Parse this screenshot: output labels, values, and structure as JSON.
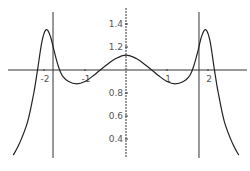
{
  "chart_data": {
    "type": "line",
    "title": "",
    "xlabel": "",
    "ylabel": "",
    "xlim": [
      -2.8,
      2.95
    ],
    "ylim": [
      0.25,
      1.55
    ],
    "axes_cross_at": {
      "x": 0,
      "y": 1.0
    },
    "grid": false,
    "legend": null,
    "x_ticks": [
      {
        "value": -2,
        "label": "-2"
      },
      {
        "value": -1,
        "label": "-1"
      },
      {
        "value": 1,
        "label": "1"
      },
      {
        "value": 2,
        "label": "2"
      }
    ],
    "y_ticks": [
      {
        "value": 1.4,
        "label": "1.4"
      },
      {
        "value": 1.2,
        "label": "1.2"
      },
      {
        "value": 0.8,
        "label": "0.8"
      },
      {
        "value": 0.6,
        "label": "0.6"
      },
      {
        "value": 0.4,
        "label": "0.4"
      }
    ],
    "vertical_lines": [
      -1.78,
      1.78
    ],
    "series": [
      {
        "name": "f(x)",
        "x": [
          -2.75,
          -2.6,
          -2.4,
          -2.25,
          -2.15,
          -2.05,
          -1.95,
          -1.85,
          -1.75,
          -1.65,
          -1.55,
          -1.4,
          -1.2,
          -1.0,
          -0.8,
          -0.63,
          -0.45,
          -0.25,
          0,
          0.25,
          0.45,
          0.63,
          0.8,
          1.0,
          1.2,
          1.4,
          1.55,
          1.65,
          1.75,
          1.85,
          1.95,
          2.05,
          2.15,
          2.25,
          2.4,
          2.6,
          2.75
        ],
        "y": [
          0.26,
          0.36,
          0.55,
          0.8,
          1.02,
          1.25,
          1.35,
          1.3,
          1.16,
          1.03,
          0.95,
          0.9,
          0.88,
          0.9,
          0.95,
          1.0,
          1.05,
          1.1,
          1.13,
          1.1,
          1.05,
          1.0,
          0.95,
          0.9,
          0.88,
          0.9,
          0.95,
          1.03,
          1.16,
          1.3,
          1.35,
          1.25,
          1.02,
          0.8,
          0.55,
          0.36,
          0.26
        ]
      }
    ]
  }
}
